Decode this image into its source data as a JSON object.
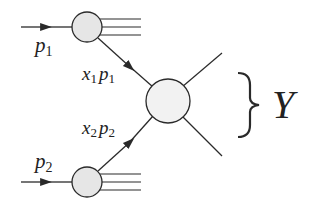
{
  "diagram": {
    "type": "Feynman-style parton scattering diagram",
    "colors": {
      "line": "#2a2a2a",
      "blob_fill": "#e6e6e6",
      "central_fill": "#f2f2f2",
      "text": "#222222"
    },
    "incoming": [
      {
        "label_main": "p",
        "label_sub": "1"
      },
      {
        "label_main": "p",
        "label_sub": "2"
      }
    ],
    "partons": [
      {
        "label_x": "x",
        "label_x_sub": "1",
        "label_p": "p",
        "label_p_sub": "1"
      },
      {
        "label_x": "x",
        "label_x_sub": "2",
        "label_p": "p",
        "label_p_sub": "2"
      }
    ],
    "final_state": {
      "label": "Y",
      "brace": "}"
    }
  }
}
